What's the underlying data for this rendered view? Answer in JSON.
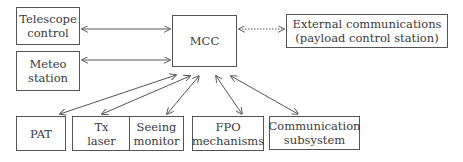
{
  "diagram": {
    "center": {
      "label": "MCC"
    },
    "nodes": {
      "telescope": {
        "line1": "Telescope",
        "line2": "control"
      },
      "meteo": {
        "line1": "Meteo",
        "line2": "station"
      },
      "external": {
        "line1": "External communications",
        "line2": "(payload control station)"
      },
      "pat": {
        "line1": "PAT"
      },
      "tx": {
        "line1": "Tx",
        "line2": "laser"
      },
      "seeing": {
        "line1": "Seeing",
        "line2": "monitor"
      },
      "fpo": {
        "line1": "FPO",
        "line2": "mechanisms"
      },
      "comm": {
        "line1": "Communication",
        "line2": "subsystem"
      }
    },
    "edges": [
      {
        "from": "telescope",
        "to": "MCC",
        "style": "solid",
        "direction": "both"
      },
      {
        "from": "meteo",
        "to": "MCC",
        "style": "solid",
        "direction": "both"
      },
      {
        "from": "MCC",
        "to": "external",
        "style": "dotted",
        "direction": "both"
      },
      {
        "from": "MCC",
        "to": "pat",
        "style": "solid",
        "direction": "both"
      },
      {
        "from": "MCC",
        "to": "tx",
        "style": "solid",
        "direction": "both"
      },
      {
        "from": "MCC",
        "to": "seeing",
        "style": "solid",
        "direction": "both"
      },
      {
        "from": "MCC",
        "to": "fpo",
        "style": "solid",
        "direction": "both"
      },
      {
        "from": "MCC",
        "to": "comm",
        "style": "solid",
        "direction": "both"
      }
    ],
    "colors": {
      "line": "#555555",
      "text": "#3a3a3a",
      "background": "#ffffff"
    }
  }
}
